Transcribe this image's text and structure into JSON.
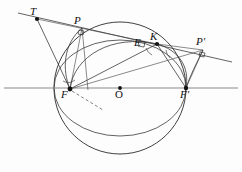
{
  "figure": {
    "width": 242,
    "height": 172,
    "background_color": "#fdfdfd",
    "ink_color": "#2b2b2b",
    "axis_color": "#8a8a8a"
  },
  "points": [
    {
      "id": "T",
      "label": "T",
      "x": 37,
      "y": 19,
      "label_x": 30,
      "label_y": 6,
      "marker": "dot"
    },
    {
      "id": "P",
      "label": "P",
      "x": 82,
      "y": 28,
      "label_x": 74,
      "label_y": 15,
      "marker": "none"
    },
    {
      "id": "K",
      "label": "K",
      "x": 157,
      "y": 44,
      "label_x": 150,
      "label_y": 31,
      "marker": "dot"
    },
    {
      "id": "E",
      "label": "E",
      "x": 141,
      "y": 45,
      "label_x": 134,
      "label_y": 37,
      "marker": "none"
    },
    {
      "id": "Pp",
      "label": "P'",
      "x": 203,
      "y": 50,
      "label_x": 196,
      "label_y": 36,
      "marker": "none"
    },
    {
      "id": "F",
      "label": "F",
      "x": 70,
      "y": 89,
      "label_x": 61,
      "label_y": 89,
      "marker": "dot"
    },
    {
      "id": "O",
      "label": "O",
      "x": 120,
      "y": 88,
      "label_x": 115,
      "label_y": 89,
      "marker": "ring"
    },
    {
      "id": "Fp",
      "label": "F'",
      "x": 186,
      "y": 88,
      "label_x": 180,
      "label_y": 89,
      "marker": "dot"
    }
  ],
  "curves": {
    "major_circle": {
      "name": "director-circle",
      "cx": 120,
      "cy": 88,
      "rx": 66,
      "ry": 66
    },
    "inner_ellipse": {
      "name": "ellipse",
      "cx": 120,
      "cy": 88,
      "rx": 66,
      "ry": 48
    }
  },
  "axis": {
    "name": "major-axis",
    "x1": 4,
    "y1": 88,
    "x2": 238,
    "y2": 88
  },
  "segments": [
    {
      "name": "tangent-line-T-P-Pprime",
      "x1": 18,
      "y1": 13,
      "x2": 232,
      "y2": 62
    },
    {
      "name": "segment-T-F",
      "x1": 37,
      "y1": 19,
      "x2": 70,
      "y2": 89
    },
    {
      "name": "segment-T-K",
      "x1": 37,
      "y1": 19,
      "x2": 157,
      "y2": 44
    },
    {
      "name": "segment-F-K",
      "x1": 70,
      "y1": 89,
      "x2": 157,
      "y2": 44
    },
    {
      "name": "segment-F-Pprime",
      "x1": 70,
      "y1": 89,
      "x2": 203,
      "y2": 50
    },
    {
      "name": "segment-K-Fprime",
      "x1": 157,
      "y1": 44,
      "x2": 186,
      "y2": 88
    },
    {
      "name": "segment-Pprime-Fprime",
      "x1": 203,
      "y1": 50,
      "x2": 186,
      "y2": 88
    },
    {
      "name": "segment-P-F",
      "x1": 82,
      "y1": 28,
      "x2": 70,
      "y2": 89
    },
    {
      "name": "segment-P-down",
      "x1": 82,
      "y1": 28,
      "x2": 88,
      "y2": 90
    },
    {
      "name": "segment-K-Pprime-chord",
      "x1": 157,
      "y1": 44,
      "x2": 203,
      "y2": 50
    },
    {
      "name": "reflection-ray-dashed",
      "x1": 72,
      "y1": 91,
      "x2": 103,
      "y2": 110
    }
  ],
  "arcs": [
    {
      "name": "arc-F-to-K-upper",
      "d": "M 70 89 C 74 56, 112 34, 157 44"
    },
    {
      "name": "arc-P-to-F-left",
      "d": "M 82 28 C 63 44, 62 70, 70 89"
    },
    {
      "name": "arc-K-to-Fprime",
      "d": "M 157 44 C 178 50, 190 66, 186 88"
    },
    {
      "name": "arc-Pprime-curve",
      "d": "M 203 50 C 196 64, 190 76, 186 88"
    }
  ],
  "angle_marks": [
    {
      "name": "right-angle-at-P",
      "x": 82,
      "y": 28,
      "kind": "square"
    },
    {
      "name": "right-angle-at-Pprime",
      "x": 203,
      "y": 50,
      "kind": "square"
    },
    {
      "name": "right-angle-at-E",
      "x": 143,
      "y": 43,
      "kind": "square"
    },
    {
      "name": "angle-arc-at-F",
      "x": 70,
      "y": 89,
      "kind": "arc"
    },
    {
      "name": "angle-arc-at-K-left",
      "x": 157,
      "y": 44,
      "kind": "arc"
    },
    {
      "name": "angle-arc-at-K-right",
      "x": 157,
      "y": 44,
      "kind": "arc"
    }
  ]
}
